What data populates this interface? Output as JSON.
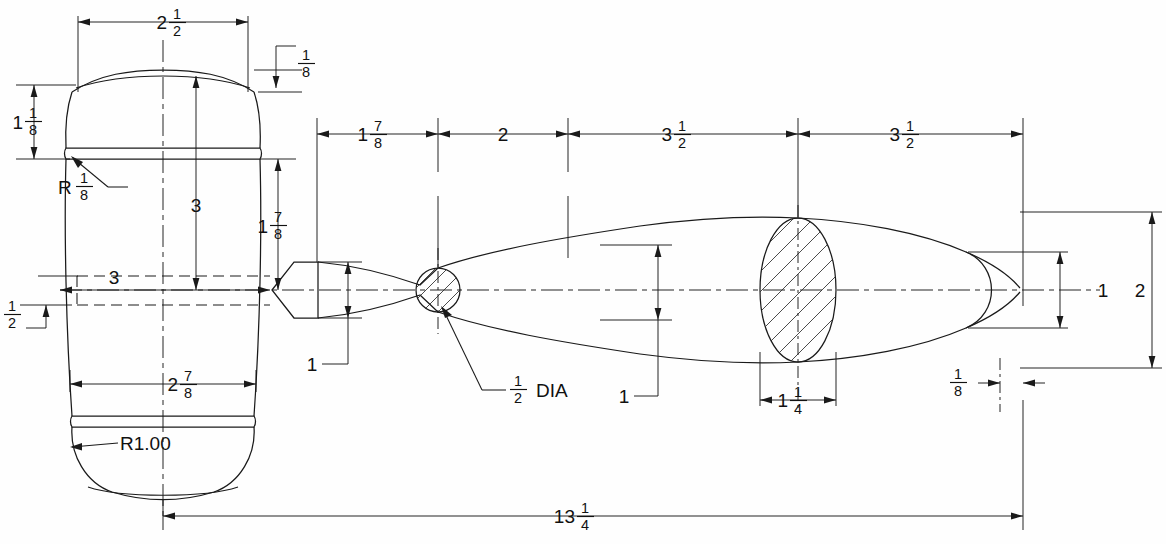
{
  "drawing": {
    "title": "Mallet Assembly Detail Drawing",
    "subject": "Wooden mallet — head (left, front view) and handle (right, profile view)",
    "units": "inches",
    "line_color": "#1a1a1a",
    "background_color": "#ffffff",
    "views": [
      {
        "name": "mallet-head-view",
        "label": "Mallet Head"
      },
      {
        "name": "handle-profile-view",
        "label": "Handle Profile"
      }
    ],
    "dimensions": [
      {
        "id": "head-top-width",
        "name": "head-top-width-dimension",
        "whole": "2",
        "numerator": "1",
        "denominator": "2",
        "text": "2 1/2",
        "orientation": "horizontal",
        "view": "mallet-head-view"
      },
      {
        "id": "head-chamfer",
        "name": "head-top-chamfer-dimension",
        "whole": "",
        "numerator": "1",
        "denominator": "8",
        "text": "1/8",
        "orientation": "vertical",
        "view": "mallet-head-view"
      },
      {
        "id": "head-upper-height",
        "name": "head-upper-height-dimension",
        "whole": "1",
        "numerator": "1",
        "denominator": "8",
        "text": "1 1/8",
        "orientation": "vertical",
        "view": "mallet-head-view"
      },
      {
        "id": "head-groove-radius",
        "name": "head-groove-radius-callout",
        "whole": "",
        "numerator": "1",
        "denominator": "8",
        "prefix": "R",
        "text": "R 1/8",
        "orientation": "leader",
        "view": "mallet-head-view"
      },
      {
        "id": "head-center-height",
        "name": "head-center-height-dimension",
        "whole": "3",
        "numerator": "",
        "denominator": "",
        "text": "3",
        "orientation": "vertical",
        "view": "mallet-head-view"
      },
      {
        "id": "head-lower-height",
        "name": "head-lower-height-dimension",
        "whole": "1",
        "numerator": "7",
        "denominator": "8",
        "text": "1 7/8",
        "orientation": "vertical",
        "view": "mallet-head-view"
      },
      {
        "id": "head-bore-width",
        "name": "head-bore-width-dimension",
        "whole": "3",
        "numerator": "",
        "denominator": "",
        "text": "3",
        "orientation": "horizontal",
        "view": "mallet-head-view"
      },
      {
        "id": "head-bore-offset",
        "name": "head-bore-offset-dimension",
        "whole": "",
        "numerator": "1",
        "denominator": "2",
        "text": "1/2",
        "orientation": "vertical",
        "view": "mallet-head-view"
      },
      {
        "id": "head-bottom-width",
        "name": "head-bottom-width-dimension",
        "whole": "2",
        "numerator": "7",
        "denominator": "8",
        "text": "2 7/8",
        "orientation": "horizontal",
        "view": "mallet-head-view"
      },
      {
        "id": "head-bottom-radius",
        "name": "head-bottom-radius-callout",
        "whole": "",
        "numerator": "",
        "denominator": "",
        "text": "R1.00",
        "orientation": "leader",
        "view": "mallet-head-view"
      },
      {
        "id": "handle-seg-1",
        "name": "handle-segment-1-dimension",
        "whole": "1",
        "numerator": "7",
        "denominator": "8",
        "text": "1 7/8",
        "orientation": "horizontal",
        "view": "handle-profile-view"
      },
      {
        "id": "handle-seg-2",
        "name": "handle-segment-2-dimension",
        "whole": "2",
        "numerator": "",
        "denominator": "",
        "text": "2",
        "orientation": "horizontal",
        "view": "handle-profile-view"
      },
      {
        "id": "handle-seg-3",
        "name": "handle-segment-3-dimension",
        "whole": "3",
        "numerator": "1",
        "denominator": "2",
        "text": "3 1/2",
        "orientation": "horizontal",
        "view": "handle-profile-view"
      },
      {
        "id": "handle-seg-4",
        "name": "handle-segment-4-dimension",
        "whole": "3",
        "numerator": "1",
        "denominator": "2",
        "text": "3 1/2",
        "orientation": "horizontal",
        "view": "handle-profile-view"
      },
      {
        "id": "handle-neck-height",
        "name": "handle-neck-height-dimension",
        "whole": "1",
        "numerator": "",
        "denominator": "",
        "text": "1",
        "orientation": "vertical",
        "view": "handle-profile-view"
      },
      {
        "id": "handle-waist-dia",
        "name": "handle-waist-diameter-callout",
        "whole": "",
        "numerator": "1",
        "denominator": "2",
        "suffix": "DIA",
        "text": "1/2 DIA",
        "orientation": "leader",
        "view": "handle-profile-view"
      },
      {
        "id": "handle-mid-height",
        "name": "handle-mid-height-dimension",
        "whole": "1",
        "numerator": "",
        "denominator": "",
        "text": "1",
        "orientation": "vertical",
        "view": "handle-profile-view"
      },
      {
        "id": "handle-grip-width",
        "name": "handle-grip-section-width-dimension",
        "whole": "1",
        "numerator": "1",
        "denominator": "4",
        "text": "1 1/4",
        "orientation": "horizontal",
        "view": "handle-profile-view"
      },
      {
        "id": "handle-end-height",
        "name": "handle-end-height-dimension",
        "whole": "1",
        "numerator": "",
        "denominator": "",
        "text": "1",
        "orientation": "vertical",
        "view": "handle-profile-view"
      },
      {
        "id": "handle-envelope-height",
        "name": "handle-envelope-height-dimension",
        "whole": "2",
        "numerator": "",
        "denominator": "",
        "text": "2",
        "orientation": "vertical",
        "view": "handle-profile-view"
      },
      {
        "id": "handle-tip-offset",
        "name": "handle-tip-offset-dimension",
        "whole": "",
        "numerator": "1",
        "denominator": "8",
        "text": "1/8",
        "orientation": "horizontal",
        "view": "handle-profile-view"
      },
      {
        "id": "overall-length",
        "name": "overall-length-dimension",
        "whole": "13",
        "numerator": "1",
        "denominator": "4",
        "text": "13 1/4",
        "orientation": "horizontal",
        "view": "overall"
      }
    ],
    "section_views": [
      {
        "name": "handle-waist-section",
        "label": "1/2 DIA",
        "shape": "circle",
        "hatched": true
      },
      {
        "name": "handle-grip-section",
        "label": "1 1/4",
        "shape": "ellipse",
        "hatched": true
      }
    ]
  }
}
